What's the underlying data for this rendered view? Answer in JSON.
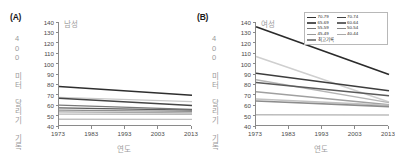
{
  "figure": {
    "panels": [
      {
        "tag": "(A)",
        "title": "남성",
        "ylabel": "400 미터 달리기 기록 (초)",
        "xlabel": "연도"
      },
      {
        "tag": "(B)",
        "title": "여성",
        "ylabel": "400 미터 달리기 기록 (초)",
        "xlabel": "연도"
      }
    ],
    "legend": {
      "col1": [
        {
          "label": "70-79",
          "color": "#333333"
        },
        {
          "label": "65-69",
          "color": "#555555"
        },
        {
          "label": "55-59",
          "color": "#777777"
        },
        {
          "label": "45-49",
          "color": "#999999"
        },
        {
          "label": "최고기록",
          "color": "#888888"
        }
      ],
      "col2": [
        {
          "label": "70-74",
          "color": "#444444"
        },
        {
          "label": "60-64",
          "color": "#666666"
        },
        {
          "label": "50-54",
          "color": "#888888"
        },
        {
          "label": "40-44",
          "color": "#aaaaaa"
        }
      ]
    }
  },
  "chart_data": [
    {
      "type": "line",
      "panel": "(A)",
      "title": "남성",
      "xlabel": "연도",
      "ylabel": "400 미터 달리기 기록 (초)",
      "x": [
        1973,
        2013
      ],
      "xlim": [
        1973,
        2013
      ],
      "ylim": [
        40,
        140
      ],
      "ytick_labels": [
        "40",
        "50",
        "60",
        "70",
        "80",
        "90",
        "100",
        "110",
        "120",
        "130",
        "140"
      ],
      "xtick_labels": [
        "1973",
        "1983",
        "1993",
        "2003",
        "2013"
      ],
      "grid": false,
      "legend_position": "none",
      "series": [
        {
          "name": "70-79",
          "values": [
            78.0,
            69.6
          ],
          "color": "#2e2e2e",
          "width": 1.5
        },
        {
          "name": "70-74",
          "values": [
            67.5,
            63.5
          ],
          "color": "#c9c9c9",
          "width": 1.2
        },
        {
          "name": "65-69",
          "values": [
            66.6,
            59.8
          ],
          "color": "#454545",
          "width": 1.5
        },
        {
          "name": "60-64",
          "values": [
            60.0,
            56.0
          ],
          "color": "#787878",
          "width": 1.3
        },
        {
          "name": "55-59",
          "values": [
            57.4,
            55.2
          ],
          "color": "#5c5c5c",
          "width": 1.3
        },
        {
          "name": "50-54",
          "values": [
            55.3,
            54.0
          ],
          "color": "#8f8f8f",
          "width": 1.3
        },
        {
          "name": "45-49",
          "values": [
            53.5,
            52.6
          ],
          "color": "#a8a8a8",
          "width": 1.3
        },
        {
          "name": "40-44",
          "values": [
            51.5,
            51.3
          ],
          "color": "#b8b8b8",
          "width": 1.3
        },
        {
          "name": "최고기록",
          "values": [
            46.5,
            46.3
          ],
          "color": "#c0c0c0",
          "width": 1.3
        }
      ]
    },
    {
      "type": "line",
      "panel": "(B)",
      "title": "여성",
      "xlabel": "연도",
      "ylabel": "400 미터 달리기 기록 (초)",
      "x": [
        1973,
        2013
      ],
      "xlim": [
        1973,
        2013
      ],
      "ylim": [
        40,
        140
      ],
      "ytick_labels": [
        "40",
        "50",
        "60",
        "70",
        "80",
        "90",
        "100",
        "110",
        "120",
        "130",
        "140"
      ],
      "xtick_labels": [
        "1973",
        "1983",
        "1993",
        "2003",
        "2013"
      ],
      "grid": false,
      "legend_position": "upper right",
      "series": [
        {
          "name": "70-79",
          "values": [
            135.5,
            89.5
          ],
          "color": "#2b2b2b",
          "width": 1.7
        },
        {
          "name": "70-74",
          "values": [
            106.8,
            63.0
          ],
          "color": "#cfcfcf",
          "width": 1.5
        },
        {
          "name": "65-69",
          "values": [
            90.8,
            73.8
          ],
          "color": "#3d3d3d",
          "width": 1.5
        },
        {
          "name": "60-64",
          "values": [
            84.5,
            62.5
          ],
          "color": "#b5b5b5",
          "width": 1.4
        },
        {
          "name": "55-59",
          "values": [
            81.8,
            69.0
          ],
          "color": "#5a5a5a",
          "width": 1.5
        },
        {
          "name": "50-54",
          "values": [
            73.0,
            60.5
          ],
          "color": "#a0a0a0",
          "width": 1.4
        },
        {
          "name": "45-49",
          "values": [
            66.0,
            60.0
          ],
          "color": "#c2c2c2",
          "width": 1.4
        },
        {
          "name": "40-44",
          "values": [
            64.0,
            58.6
          ],
          "color": "#8c8c8c",
          "width": 1.6
        },
        {
          "name": "최고기록",
          "values": [
            50.8,
            50.6
          ],
          "color": "#bdbdbd",
          "width": 1.4
        }
      ]
    }
  ]
}
